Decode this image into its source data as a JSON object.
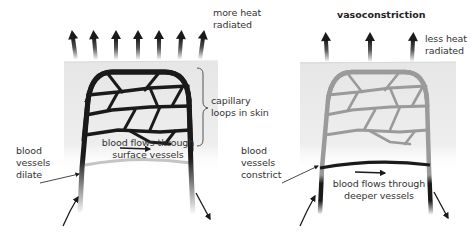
{
  "figure": {
    "colors": {
      "skin_panel": "#ececec",
      "vessel_dilated": "#1a1a1a",
      "vessel_constricted": "#9a9a9a",
      "deep_vessel_dilated": "#c4c4c4",
      "deep_vessel_constricted": "#1a1a1a",
      "heat_arrow": "#1a1a1a",
      "text": "#333333"
    },
    "left_panel": {
      "title": "",
      "heat_label_line1": "more heat",
      "heat_label_line2": "radiated",
      "heat_arrow_count": 7,
      "capillary_label_line1": "capillary",
      "capillary_label_line2": "loops in skin",
      "flow_label_line1": "blood flows through",
      "flow_label_line2": "surface vessels",
      "vessel_label_line1": "blood",
      "vessel_label_line2": "vessels",
      "vessel_label_line3": "dilate"
    },
    "right_panel": {
      "title": "vasoconstriction",
      "heat_label_line1": "less heat",
      "heat_label_line2": "radiated",
      "heat_arrow_count": 3,
      "flow_label_line1": "blood flows through",
      "flow_label_line2": "deeper vessels",
      "vessel_label_line1": "blood",
      "vessel_label_line2": "vessels",
      "vessel_label_line3": "constrict"
    }
  }
}
